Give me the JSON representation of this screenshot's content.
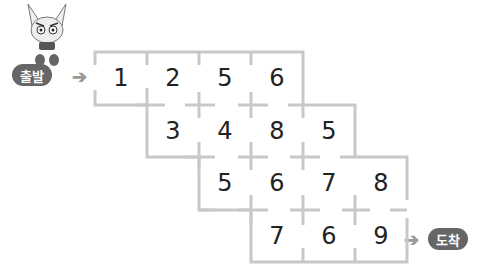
{
  "labels": {
    "start": "출발",
    "finish": "도착"
  },
  "colors": {
    "wall": "#c8c8c8",
    "pill": "#666666",
    "arrow": "#9a9a9a"
  },
  "grid": {
    "rows": [
      {
        "offset": 0,
        "cells": [
          "1",
          "2",
          "5",
          "6"
        ]
      },
      {
        "offset": 1,
        "cells": [
          "3",
          "4",
          "8",
          "5"
        ]
      },
      {
        "offset": 2,
        "cells": [
          "5",
          "6",
          "7",
          "8"
        ]
      },
      {
        "offset": 3,
        "cells": [
          "7",
          "6",
          "9"
        ]
      }
    ]
  },
  "icons": {
    "mascot": "fox-character-icon",
    "arrow": "arrow-right-icon"
  }
}
